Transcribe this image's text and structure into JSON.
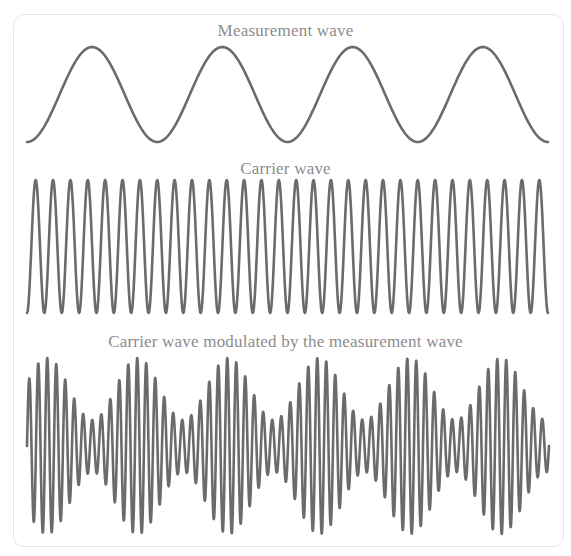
{
  "figure": {
    "panels": [
      {
        "id": "measurement",
        "title": "Measurement wave",
        "type": "cosine",
        "cycles": 4,
        "phase": "starts-at-trough",
        "x_start": 27,
        "x_end": 548,
        "y_top": 47,
        "y_bottom": 142
      },
      {
        "id": "carrier",
        "title": "Carrier wave",
        "type": "cosine",
        "cycles": 30,
        "phase": "starts-at-trough",
        "x_start": 27,
        "x_end": 548,
        "y_top": 180,
        "y_bottom": 313
      },
      {
        "id": "modulated",
        "title": "Carrier wave modulated by the measurement wave",
        "type": "amplitude-modulated",
        "carrier_cycles": 58,
        "envelope_cycles": 5.75,
        "envelope_first_max_x": 47,
        "x_start": 27,
        "x_end": 549,
        "y_center": 446,
        "amplitude_max": 88,
        "amplitude_min": 26
      }
    ],
    "stroke_color": "#6b6b6b",
    "stroke_width": 2.6,
    "title_color": "#8c8c8c",
    "card_border_color": "#e6e6e6"
  }
}
